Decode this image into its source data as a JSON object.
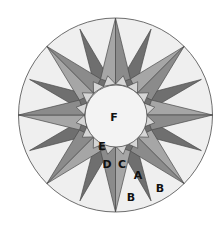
{
  "diagram": {
    "center": [
      115.5,
      115
    ],
    "outer_radius": 97,
    "inner_radius": 31,
    "point_count": 16,
    "main_point_length": 97,
    "secondary_point_length": 93,
    "base_radius": 39,
    "colors": {
      "background": "#ffffff",
      "ring_fill_B": "#efefef",
      "main_light_C": "#a6a6a6",
      "main_medium_D": "#8b8b8b",
      "secondary_dark_A": "#6f6f6f",
      "small_light_E": "#d6d6d6",
      "center_F": "#f3f3f3",
      "outline": "#4a4a4a"
    },
    "labels": [
      {
        "id": "F",
        "text": "F",
        "x": 114,
        "y": 117
      },
      {
        "id": "E",
        "text": "E",
        "x": 102,
        "y": 146
      },
      {
        "id": "D",
        "text": "D",
        "x": 107,
        "y": 164
      },
      {
        "id": "C",
        "text": "C",
        "x": 122,
        "y": 164
      },
      {
        "id": "A",
        "text": "A",
        "x": 138,
        "y": 175
      },
      {
        "id": "B1",
        "text": "B",
        "x": 131,
        "y": 197
      },
      {
        "id": "B2",
        "text": "B",
        "x": 160,
        "y": 188
      }
    ]
  }
}
